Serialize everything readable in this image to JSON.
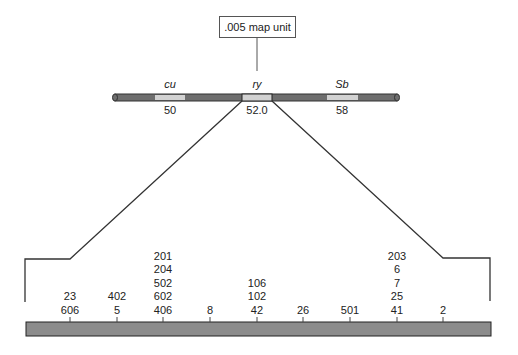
{
  "scale_label": ".005 map unit",
  "chromosome": {
    "genes": [
      {
        "name": "cu",
        "position": "50",
        "x": 170
      },
      {
        "name": "ry",
        "position": "52.0",
        "x": 257
      },
      {
        "name": "Sb",
        "position": "58",
        "x": 342
      }
    ]
  },
  "fine_map": {
    "sites": [
      {
        "x": 70,
        "labels": [
          "23",
          "606"
        ]
      },
      {
        "x": 117,
        "labels": [
          "402",
          "5"
        ]
      },
      {
        "x": 163,
        "labels": [
          "201",
          "204",
          "502",
          "602",
          "406"
        ]
      },
      {
        "x": 210,
        "labels": [
          "8"
        ]
      },
      {
        "x": 257,
        "labels": [
          "106",
          "102",
          "42"
        ]
      },
      {
        "x": 303,
        "labels": [
          "26"
        ]
      },
      {
        "x": 350,
        "labels": [
          "501"
        ]
      },
      {
        "x": 397,
        "labels": [
          "203",
          "6",
          "7",
          "25",
          "41"
        ]
      },
      {
        "x": 443,
        "labels": [
          "2"
        ]
      }
    ]
  },
  "colors": {
    "chromosome": "#707070",
    "band": "#d0d0d0",
    "bar": "#8c8c8c",
    "line": "#333333"
  }
}
